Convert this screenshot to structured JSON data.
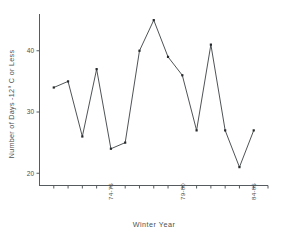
{
  "chart_data": {
    "type": "line",
    "title": "",
    "subtitle": "",
    "xlabel": "Winter Year",
    "ylabel": "Number of Days -12° C or Less",
    "ylim": [
      18,
      46
    ],
    "xlim": [
      0,
      16
    ],
    "grid": false,
    "legend": false,
    "legend_position": "none",
    "marker": "filled-square",
    "yticks": [
      20,
      30,
      40
    ],
    "ytick_labels": [
      "20",
      "30",
      "40"
    ],
    "xtick_labels": [
      "74-75",
      "79-80",
      "84-85"
    ],
    "xtick_label_rotation": -90,
    "xtick_label_positions": [
      5,
      10,
      15
    ],
    "categories": [
      "70-71",
      "71-72",
      "72-73",
      "73-74",
      "74-75",
      "75-76",
      "76-77",
      "77-78",
      "78-79",
      "79-80",
      "80-81",
      "81-82",
      "82-83",
      "83-84",
      "84-85"
    ],
    "x": [
      1,
      2,
      3,
      4,
      5,
      6,
      7,
      8,
      9,
      10,
      11,
      12,
      13,
      14,
      15
    ],
    "values": [
      34,
      35,
      26,
      37,
      24,
      25,
      40,
      45,
      39,
      36,
      27,
      41,
      27,
      21,
      27
    ],
    "series": [
      {
        "name": "Number of Days -12° C or Less",
        "values": [
          34,
          35,
          26,
          37,
          24,
          25,
          40,
          45,
          39,
          36,
          27,
          41,
          27,
          21,
          27
        ]
      }
    ],
    "annotations": [],
    "line_color": "#3a3f42",
    "marker_color": "#26292b",
    "axis_color": "#555b5e",
    "background_color": "#ffffff"
  },
  "figure": {
    "x_axis_title": "Winter Year",
    "y_axis_title": "Number of Days -12° C or Less"
  }
}
